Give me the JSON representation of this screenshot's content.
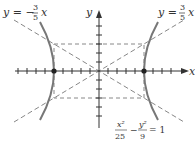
{
  "figure": {
    "type": "hyperbola",
    "equation": {
      "x_numerator": "x²",
      "x_denominator": "25",
      "minus": "−",
      "y_numerator": "y²",
      "y_denominator": "9",
      "equals": "= 1"
    },
    "asymptotes": [
      {
        "label_lhs": "y = −",
        "num": "3",
        "den": "5",
        "var": "x",
        "slope": -0.6
      },
      {
        "label_lhs": "y = ",
        "num": "3",
        "den": "5",
        "var": "x",
        "slope": 0.6
      }
    ],
    "axes": {
      "x_label": "x",
      "y_label": "y"
    },
    "a": 5,
    "b": 3,
    "vertices": [
      [
        -5,
        0
      ],
      [
        5,
        0
      ]
    ],
    "colors": {
      "curve": "#777777",
      "axis": "#333333",
      "dashed": "#888888",
      "vertex": "#222222"
    }
  }
}
